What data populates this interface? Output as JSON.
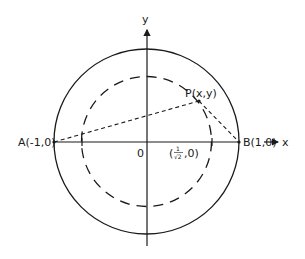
{
  "figure": {
    "type": "geometry-diagram",
    "labels": {
      "y_axis": "y",
      "x_axis": "x",
      "origin": "0",
      "point_a": "A(-1,0)",
      "point_b": "B(1,0)",
      "point_p": "P(x,y)",
      "inner_intercept_open": "(",
      "inner_intercept_num": "1",
      "inner_intercept_den": "√2",
      "inner_intercept_close": ",0)"
    },
    "shapes": {
      "outer_circle": {
        "style": "solid",
        "radius": 1
      },
      "inner_circle": {
        "style": "dashed",
        "radius": "1/√2"
      },
      "segment_AP": {
        "style": "dashed"
      },
      "segment_PB": {
        "style": "dashed"
      }
    },
    "colors": {
      "stroke": "#1a1a1a",
      "background": "#ffffff"
    }
  }
}
